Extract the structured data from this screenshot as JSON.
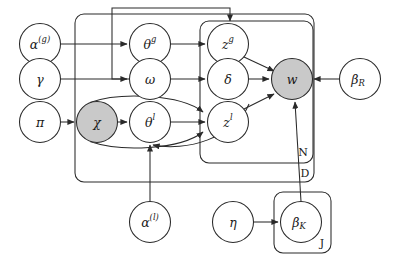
{
  "diagram": {
    "type": "plate-notation-graphical-model",
    "nodes": [
      {
        "id": "alpha_g",
        "base": "α",
        "sup": "(g)",
        "sub": "",
        "cx": 40,
        "cy": 44,
        "r": 20.5,
        "shaded": false
      },
      {
        "id": "gamma",
        "base": "γ",
        "sup": "",
        "sub": "",
        "cx": 40,
        "cy": 79,
        "r": 20.5,
        "shaded": false
      },
      {
        "id": "pi",
        "base": "π",
        "sup": "",
        "sub": "",
        "cx": 40,
        "cy": 122,
        "r": 20.5,
        "shaded": false
      },
      {
        "id": "theta_g",
        "base": "θ",
        "sup": "g",
        "sub": "",
        "cx": 150,
        "cy": 44,
        "r": 20.5,
        "shaded": false
      },
      {
        "id": "omega",
        "base": "ω",
        "sup": "",
        "sub": "",
        "cx": 150,
        "cy": 79,
        "r": 20.5,
        "shaded": false
      },
      {
        "id": "chi",
        "base": "χ",
        "sup": "",
        "sub": "",
        "cx": 97,
        "cy": 122,
        "r": 20.5,
        "shaded": true
      },
      {
        "id": "theta_l",
        "base": "θ",
        "sup": "l",
        "sub": "",
        "cx": 150,
        "cy": 122,
        "r": 20.5,
        "shaded": false
      },
      {
        "id": "z_g",
        "base": "z",
        "sup": "g",
        "sub": "",
        "cx": 228,
        "cy": 44,
        "r": 20.5,
        "shaded": false
      },
      {
        "id": "delta",
        "base": "δ",
        "sup": "",
        "sub": "",
        "cx": 228,
        "cy": 79,
        "r": 20.5,
        "shaded": false
      },
      {
        "id": "z_l",
        "base": "z",
        "sup": "l",
        "sub": "",
        "cx": 228,
        "cy": 122,
        "r": 20.5,
        "shaded": false
      },
      {
        "id": "w",
        "base": "w",
        "sup": "",
        "sub": "",
        "cx": 292,
        "cy": 79,
        "r": 20.5,
        "shaded": true
      },
      {
        "id": "beta_R",
        "base": "β",
        "sup": "",
        "sub": "R",
        "cx": 360,
        "cy": 79,
        "r": 20.5,
        "shaded": false
      },
      {
        "id": "alpha_l",
        "base": "α",
        "sup": "(l)",
        "sub": "",
        "cx": 150,
        "cy": 222,
        "r": 20.5,
        "shaded": false
      },
      {
        "id": "eta",
        "base": "η",
        "sup": "",
        "sub": "",
        "cx": 233,
        "cy": 222,
        "r": 20.5,
        "shaded": false
      },
      {
        "id": "beta_K",
        "base": "β",
        "sup": "",
        "sub": "K",
        "cx": 301,
        "cy": 222,
        "r": 20.5,
        "shaded": false
      }
    ],
    "plates": [
      {
        "id": "plate_D",
        "label": "D",
        "x": 75,
        "y": 14,
        "w": 239,
        "h": 168,
        "label_x": 305,
        "label_y": 173
      },
      {
        "id": "plate_N",
        "label": "N",
        "x": 200,
        "y": 21,
        "w": 113,
        "h": 142,
        "label_x": 303,
        "label_y": 152
      },
      {
        "id": "plate_J",
        "label": "J",
        "x": 274,
        "y": 192,
        "w": 57,
        "h": 61,
        "label_x": 322,
        "label_y": 243
      }
    ],
    "edges": [
      {
        "from": "alpha_g",
        "to": "theta_g",
        "shape": "straight"
      },
      {
        "from": "gamma",
        "to": "omega",
        "shape": "straight"
      },
      {
        "from": "pi",
        "to": "chi",
        "shape": "straight"
      },
      {
        "from": "chi",
        "to": "theta_l",
        "shape": "straight"
      },
      {
        "from": "theta_g",
        "to": "z_g",
        "shape": "straight"
      },
      {
        "from": "omega",
        "to": "delta",
        "shape": "straight"
      },
      {
        "from": "theta_l",
        "to": "z_l",
        "shape": "straight"
      },
      {
        "from": "chi",
        "to": "z_l",
        "shape": "curved-upper"
      },
      {
        "from": "chi",
        "to": "z_l",
        "shape": "curved-lower"
      },
      {
        "from": "z_g",
        "to": "w",
        "shape": "straight"
      },
      {
        "from": "delta",
        "to": "w",
        "shape": "straight"
      },
      {
        "from": "z_l",
        "to": "w",
        "shape": "straight"
      },
      {
        "from": "beta_R",
        "to": "w",
        "shape": "straight"
      },
      {
        "from": "alpha_l",
        "to": "theta_l",
        "shape": "straight"
      },
      {
        "from": "eta",
        "to": "beta_K",
        "shape": "straight"
      },
      {
        "from": "beta_K",
        "to": "w",
        "shape": "straight-vertical"
      },
      {
        "from": "omega",
        "to": "theta_g",
        "shape": "routed-left-top"
      }
    ]
  }
}
